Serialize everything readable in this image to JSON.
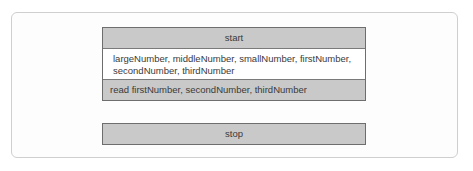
{
  "diagram": {
    "type": "nassi-shneiderman",
    "colors": {
      "block_fill": "#c9c9c9",
      "block_border": "#6e6e6e",
      "declaration_fill": "#ffffff",
      "frame_border": "#cfcfcf"
    },
    "start_label": "start",
    "declaration_text": "largeNumber, middleNumber, smallNumber, firstNumber, secondNumber, thirdNumber",
    "read_text": "read firstNumber, secondNumber, thirdNumber",
    "stop_label": "stop"
  }
}
